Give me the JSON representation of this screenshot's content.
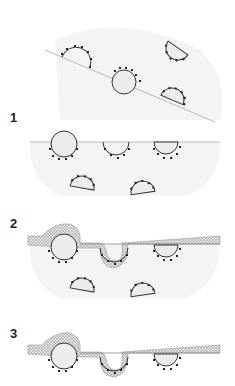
{
  "figure": {
    "panels": [
      {
        "id": "0",
        "label": ""
      },
      {
        "id": "1",
        "label": "1"
      },
      {
        "id": "2",
        "label": "2"
      },
      {
        "id": "3",
        "label": "3"
      }
    ]
  },
  "colors": {
    "background": "#ffffff",
    "region_fill": "#f4f4f4",
    "shape_fill": "#ececec",
    "stroke": "#333333",
    "line": "#aaaaaa",
    "crosshatch": "#bbbbbb",
    "layer_shadow": "#9a9a9a"
  }
}
